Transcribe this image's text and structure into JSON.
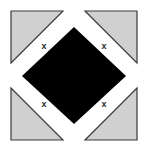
{
  "figure": {
    "canvas": {
      "width": 148,
      "height": 151,
      "background": "#ffffff"
    },
    "colors": {
      "background": "#ffffff",
      "triangle_fill": "#d0d0d0",
      "triangle_stroke": "#3a3a3a",
      "square_fill": "#000000",
      "mark_color": "#2b2b2b"
    },
    "center_square": {
      "name": "black-diamond",
      "fill": "#000000",
      "rotation_degrees": 45,
      "vertices": [
        {
          "label": "top",
          "x": 74,
          "y": 27
        },
        {
          "label": "right",
          "x": 126,
          "y": 76
        },
        {
          "label": "bottom",
          "x": 74,
          "y": 124
        },
        {
          "label": "left",
          "x": 22,
          "y": 76
        }
      ]
    },
    "corner_triangles": [
      {
        "name": "triangle-top-left",
        "position": "top-left",
        "right_angle_corner": "top-left",
        "fill": "#d0d0d0",
        "stroke": "#3a3a3a",
        "points": "11,11 63,11 11,63"
      },
      {
        "name": "triangle-top-right",
        "position": "top-right",
        "right_angle_corner": "top-right",
        "fill": "#d0d0d0",
        "stroke": "#3a3a3a",
        "points": "137,11 137,63 85,11"
      },
      {
        "name": "triangle-bottom-left",
        "position": "bottom-left",
        "right_angle_corner": "bottom-left",
        "fill": "#d0d0d0",
        "stroke": "#3a3a3a",
        "points": "11,88 11,140 63,140"
      },
      {
        "name": "triangle-bottom-right",
        "position": "bottom-right",
        "right_angle_corner": "bottom-right",
        "fill": "#d0d0d0",
        "stroke": "#3a3a3a",
        "points": "137,88 137,140 85,140"
      }
    ],
    "marks": [
      {
        "name": "cross-mark-top-left",
        "label": "x",
        "x": 44,
        "y": 46
      },
      {
        "name": "cross-mark-top-right",
        "label": "x",
        "x": 104,
        "y": 46
      },
      {
        "name": "cross-mark-bottom-left",
        "label": "x",
        "x": 44,
        "y": 104
      },
      {
        "name": "cross-mark-bottom-right",
        "label": "x",
        "x": 104,
        "y": 104
      }
    ]
  }
}
